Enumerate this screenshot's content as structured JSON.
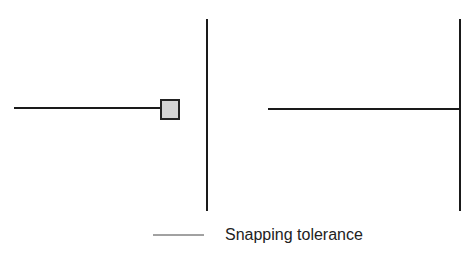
{
  "diagram": {
    "left_panel": {
      "description": "Line endpoint with snapping box near vertical line (not yet snapped)"
    },
    "right_panel": {
      "description": "Line endpoint snapped to vertical line"
    },
    "legend": {
      "label": "Snapping tolerance"
    },
    "colors": {
      "line": "#1a1a1a",
      "box_fill": "#d4d4d4",
      "box_stroke": "#222222",
      "legend_line": "#444444"
    }
  }
}
